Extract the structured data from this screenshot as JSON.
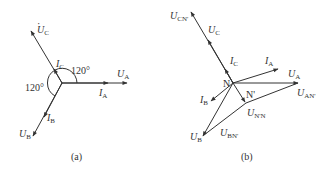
{
  "diagram_a": {
    "caption": "(a)",
    "center": [
      62,
      83
    ],
    "angle_labels": [
      "120°",
      "120°"
    ],
    "phasors": [
      {
        "id": "UA",
        "base": "U",
        "sub": "A",
        "dot": true
      },
      {
        "id": "IA",
        "base": "I",
        "sub": "A",
        "dot": true
      },
      {
        "id": "UB",
        "base": "U",
        "sub": "B",
        "dot": true
      },
      {
        "id": "IB",
        "base": "I",
        "sub": "B",
        "dot": true
      },
      {
        "id": "UC",
        "base": "U",
        "sub": "C",
        "dot": true
      },
      {
        "id": "IC",
        "base": "I",
        "sub": "C",
        "dot": true
      }
    ]
  },
  "diagram_b": {
    "caption": "(b)",
    "node_N": "N",
    "node_Nprime": "N'",
    "phasors": [
      {
        "id": "UCN",
        "base": "U",
        "sub": "CN'",
        "dot": true
      },
      {
        "id": "UC",
        "base": "U",
        "sub": "C",
        "dot": true
      },
      {
        "id": "IC",
        "base": "I",
        "sub": "C",
        "dot": true
      },
      {
        "id": "IA",
        "base": "I",
        "sub": "A",
        "dot": true
      },
      {
        "id": "UA",
        "base": "U",
        "sub": "A",
        "dot": true
      },
      {
        "id": "UAN",
        "base": "U",
        "sub": "AN'",
        "dot": true
      },
      {
        "id": "IB",
        "base": "I",
        "sub": "B",
        "dot": true
      },
      {
        "id": "UNN",
        "base": "U",
        "sub": "N'N",
        "dot": true
      },
      {
        "id": "UB",
        "base": "U",
        "sub": "B",
        "dot": true
      },
      {
        "id": "UBN",
        "base": "U",
        "sub": "BN'",
        "dot": true
      }
    ]
  }
}
